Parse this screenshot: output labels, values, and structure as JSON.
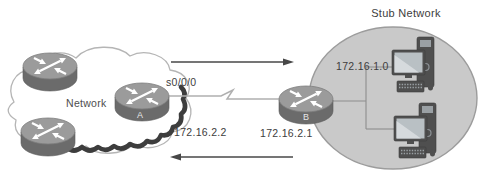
{
  "diagram": {
    "stub": {
      "title": "Stub Network",
      "subnet": "172.16.1.0"
    },
    "cloud": {
      "label": "Network"
    },
    "link": {
      "interface": "s0/0/0",
      "ip_a_side": "172.16.2.2",
      "ip_b_side": "172.16.2.1"
    },
    "routers": {
      "a": "A",
      "b": "B"
    },
    "icons": {
      "router-icon": "gray cylinder with four white crossing arrows",
      "cloud-icon": "white cloud outline with dark scalloped bottom shadow",
      "workstation-icon": "desktop tower, monitor, keyboard and mouse",
      "arrow-right-icon": "thin right-pointing route arrow",
      "arrow-left-icon": "thin left-pointing route arrow",
      "serial-link-icon": "thin line with zigzag break"
    },
    "colors": {
      "background": "#ffffff",
      "stub_fill": "#c9c9c9",
      "stub_stroke": "#9c9c9c",
      "router_top": "#9b9b9b",
      "router_side": "#6b6b6b",
      "cloud_stroke": "#b5b5b5",
      "cloud_shadow": "#3d3d3d",
      "device": "#4f4f4f",
      "screen": "#b9c0c4",
      "line": "#a8a8a8",
      "arrow": "#474747",
      "text": "#3d3d3d"
    }
  }
}
